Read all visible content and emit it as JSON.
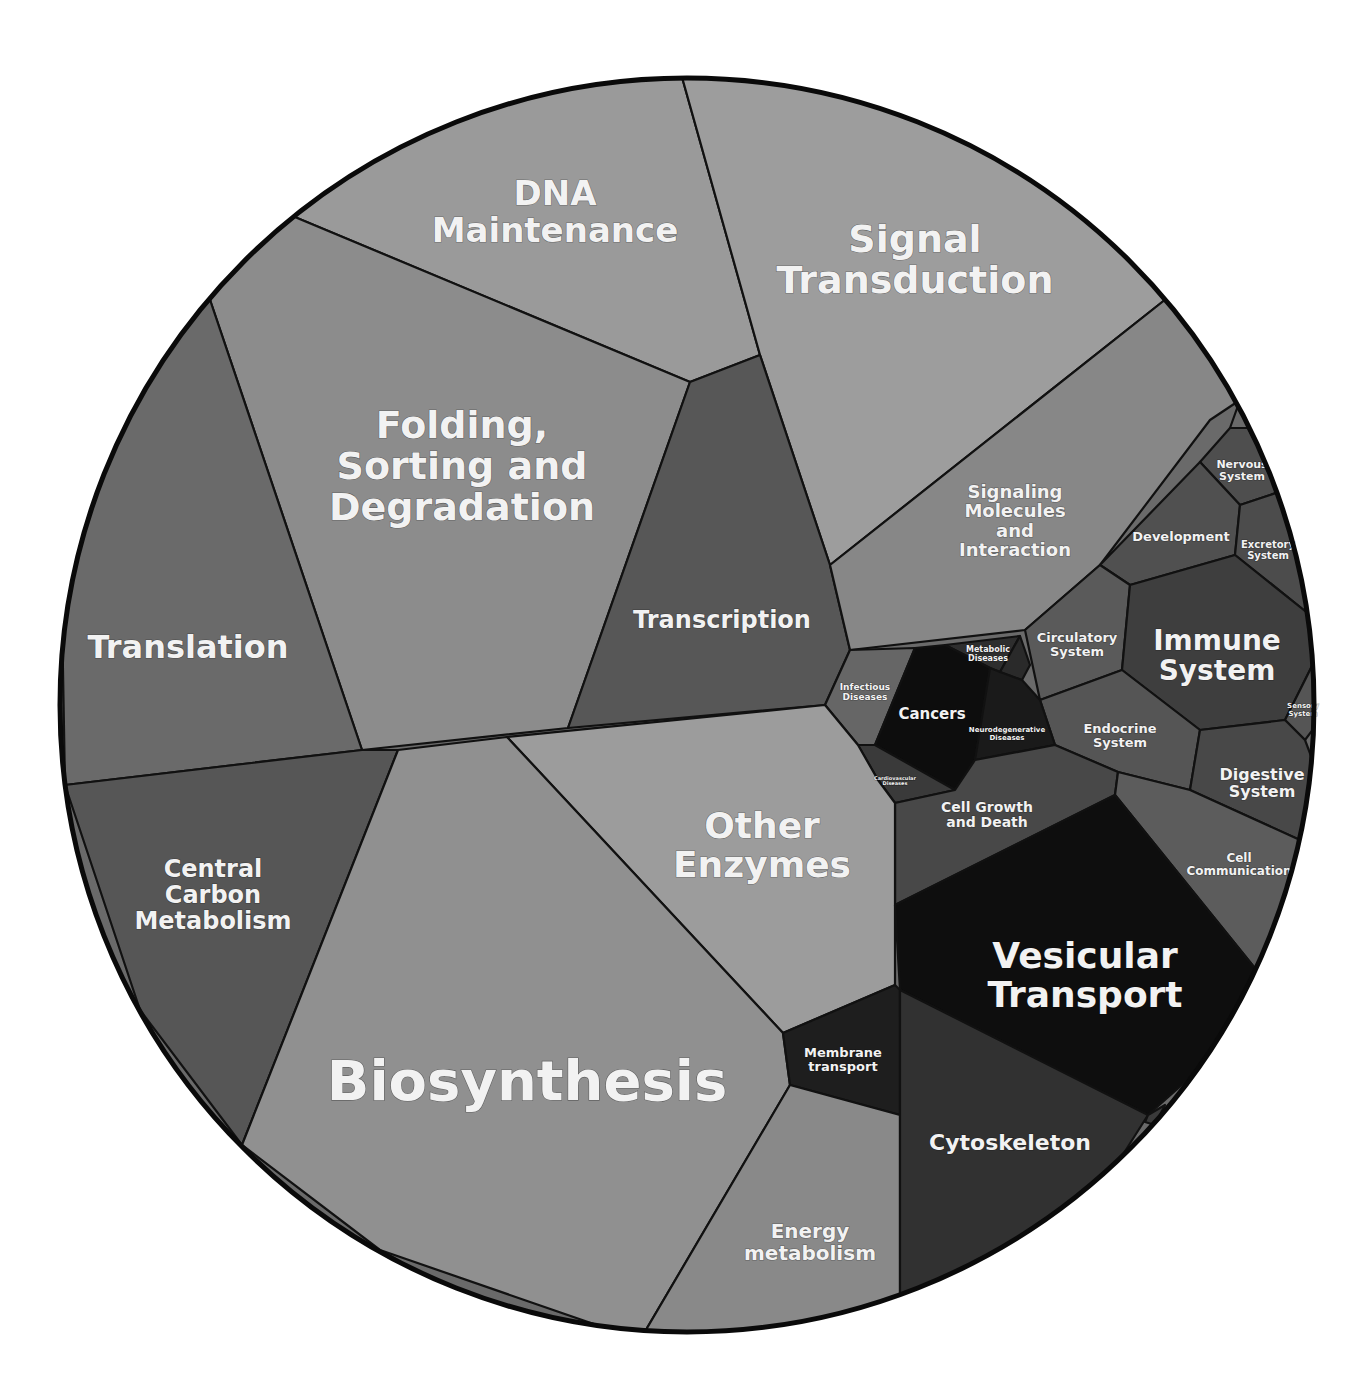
{
  "chart_data": {
    "type": "voronoi-treemap",
    "title": "",
    "center": [
      687,
      705
    ],
    "radius": 627,
    "cells": [
      {
        "id": "dna-maintenance",
        "label": [
          "DNA",
          "Maintenance"
        ],
        "fill": "#9a9a9a",
        "font": 34,
        "points": "290,215 400,120 580,75 680,70 760,355 690,382",
        "label_pos": [
          555,
          205
        ]
      },
      {
        "id": "signal-transduction",
        "label": [
          "Signal",
          "Transduction"
        ],
        "fill": "#9d9d9d",
        "font": 38,
        "points": "680,70 900,95 1100,180 1190,280 830,565 760,355",
        "label_pos": [
          915,
          252
        ]
      },
      {
        "id": "folding-sorting-degradation",
        "label": [
          "Folding,",
          "Sorting and",
          "Degradation"
        ],
        "fill": "#8c8c8c",
        "font": 38,
        "points": "205,285 290,215 690,382 568,728 362,750",
        "label_pos": [
          462,
          438
        ]
      },
      {
        "id": "translation",
        "label": [
          "Translation"
        ],
        "fill": "#6a6a6a",
        "font": 32,
        "points": "60,500 150,360 205,285 362,750 65,785",
        "label_pos": [
          188,
          658
        ]
      },
      {
        "id": "transcription",
        "label": [
          "Transcription"
        ],
        "fill": "#575757",
        "font": 24,
        "points": "690,382 760,355 830,565 850,650 825,705 568,728",
        "label_pos": [
          722,
          628
        ]
      },
      {
        "id": "signaling-molecules",
        "label": [
          "Signaling",
          "Molecules",
          "and",
          "Interaction"
        ],
        "fill": "#878787",
        "font": 18,
        "points": "830,565 1190,280 1240,400 1210,420 1100,565 1025,630 850,650",
        "label_pos": [
          1015,
          498
        ]
      },
      {
        "id": "tiny-top-right",
        "label": [
          ""
        ],
        "fill": "#6a6a6a",
        "font": 6,
        "points": "1240,400 1255,420 1248,428 1230,428",
        "label_pos": [
          1244,
          418
        ]
      },
      {
        "id": "nervous-system",
        "label": [
          "Nervous",
          "System"
        ],
        "fill": "#4e4e4e",
        "font": 11,
        "points": "1230,428 1248,428 1270,470 1285,490 1240,505 1200,462",
        "label_pos": [
          1242,
          468
        ]
      },
      {
        "id": "development",
        "label": [
          "Development"
        ],
        "fill": "#505050",
        "font": 13,
        "points": "1100,565 1200,462 1240,505 1235,555 1130,585",
        "label_pos": [
          1181,
          541
        ]
      },
      {
        "id": "excretory-system",
        "label": [
          "Excretory",
          "System"
        ],
        "fill": "#4c4c4c",
        "font": 10,
        "points": "1240,505 1285,490 1305,560 1310,615 1235,555",
        "label_pos": [
          1268,
          548
        ]
      },
      {
        "id": "circulatory-system",
        "label": [
          "Circulatory",
          "System"
        ],
        "fill": "#5a5a5a",
        "font": 13,
        "points": "1025,630 1100,565 1130,585 1122,670 1040,700",
        "label_pos": [
          1077,
          642
        ]
      },
      {
        "id": "immune-system",
        "label": [
          "Immune",
          "System"
        ],
        "fill": "#3e3e3e",
        "font": 28,
        "points": "1130,585 1235,555 1310,615 1315,660 1285,720 1200,730 1122,670",
        "label_pos": [
          1217,
          650
        ]
      },
      {
        "id": "sensory-system",
        "label": [
          "Sensory",
          "System"
        ],
        "fill": "#555555",
        "font": 7,
        "points": "1285,720 1315,660 1320,720 1305,740",
        "label_pos": [
          1303,
          708
        ]
      },
      {
        "id": "endocrine-system",
        "label": [
          "Endocrine",
          "System"
        ],
        "fill": "#555555",
        "font": 13,
        "points": "1040,700 1122,670 1200,730 1190,790 1118,772 1055,745",
        "label_pos": [
          1120,
          733
        ]
      },
      {
        "id": "digestive-system",
        "label": [
          "Digestive",
          "System"
        ],
        "fill": "#484848",
        "font": 16,
        "points": "1200,730 1285,720 1305,740 1320,780 1300,840 1190,790",
        "label_pos": [
          1262,
          780
        ]
      },
      {
        "id": "infectious-diseases",
        "label": [
          "Infectious",
          "Diseases"
        ],
        "fill": "#666666",
        "font": 9,
        "points": "850,650 915,648 875,745 858,745 825,705",
        "label_pos": [
          865,
          690
        ]
      },
      {
        "id": "metabolic-diseases",
        "label": [
          "Metabolic",
          "Diseases"
        ],
        "fill": "#2e2e2e",
        "font": 8,
        "points": "945,645 1020,636 1000,672 990,668",
        "label_pos": [
          988,
          652
        ]
      },
      {
        "id": "tiny-disease-a",
        "label": [
          ""
        ],
        "fill": "#2a2a2a",
        "font": 5,
        "points": "1000,672 1020,636 1030,665 1022,680",
        "label_pos": [
          1018,
          664
        ]
      },
      {
        "id": "cancers",
        "label": [
          "Cancers"
        ],
        "fill": "#0d0d0d",
        "font": 15,
        "points": "915,648 945,645 990,668 975,760 955,790 875,745",
        "label_pos": [
          932,
          719
        ]
      },
      {
        "id": "neurodegenerative-diseases",
        "label": [
          "Neurodegenerative",
          "Diseases"
        ],
        "fill": "#1a1a1a",
        "font": 7,
        "points": "990,668 1000,672 1022,680 1040,700 1055,745 975,760",
        "label_pos": [
          1007,
          732
        ]
      },
      {
        "id": "small-disease-b",
        "label": [
          "Cardiovascular",
          "Diseases"
        ],
        "fill": "#3a3a3a",
        "font": 5,
        "points": "858,745 875,745 955,790 895,803 878,780",
        "label_pos": [
          895,
          780
        ]
      },
      {
        "id": "cell-growth-death",
        "label": [
          "Cell Growth",
          "and Death"
        ],
        "fill": "#484848",
        "font": 14,
        "points": "895,803 955,790 975,760 1055,745 1118,772 1115,795 895,905",
        "label_pos": [
          987,
          812
        ]
      },
      {
        "id": "cell-communication",
        "label": [
          "Cell",
          "Communication"
        ],
        "fill": "#5c5c5c",
        "font": 12,
        "points": "1118,772 1190,790 1300,840 1285,930 1258,972 1115,795",
        "label_pos": [
          1239,
          862
        ]
      },
      {
        "id": "other-enzymes",
        "label": [
          "Other",
          "Enzymes"
        ],
        "fill": "#9c9c9c",
        "font": 36,
        "points": "507,737 825,705 858,745 878,780 895,803 895,985 783,1033",
        "label_pos": [
          762,
          838
        ]
      },
      {
        "id": "vesicular-transport",
        "label": [
          "Vesicular",
          "Transport"
        ],
        "fill": "#0e0e0e",
        "font": 36,
        "points": "895,905 1115,795 1258,972 1210,1060 1148,1115 900,990",
        "label_pos": [
          1085,
          968
        ]
      },
      {
        "id": "central-carbon-metabolism",
        "label": [
          "Central",
          "Carbon",
          "Metabolism"
        ],
        "fill": "#565656",
        "font": 24,
        "points": "65,785 362,750 398,750 242,1145 140,1010",
        "label_pos": [
          213,
          877
        ]
      },
      {
        "id": "biosynthesis",
        "label": [
          "Biosynthesis"
        ],
        "fill": "#909090",
        "font": 56,
        "points": "398,750 507,737 783,1033 790,1085 640,1340 380,1250 242,1145",
        "label_pos": [
          527,
          1100
        ]
      },
      {
        "id": "membrane-transport",
        "label": [
          "Membrane",
          "transport"
        ],
        "fill": "#1e1e1e",
        "font": 13,
        "points": "783,1033 895,985 900,990 900,1115 790,1085",
        "label_pos": [
          843,
          1057
        ]
      },
      {
        "id": "energy-metabolism",
        "label": [
          "Energy",
          "metabolism"
        ],
        "fill": "#898989",
        "font": 20,
        "points": "790,1085 900,1115 900,1305 780,1335 640,1340",
        "label_pos": [
          810,
          1238
        ]
      },
      {
        "id": "cytoskeleton",
        "label": [
          "Cytoskeleton"
        ],
        "fill": "#313131",
        "font": 22,
        "points": "900,990 1148,1115 1110,1175 1000,1260 900,1305",
        "label_pos": [
          1010,
          1150
        ]
      },
      {
        "id": "tiny-bottom-right",
        "label": [
          ""
        ],
        "fill": "#3a3a3a",
        "font": 4,
        "points": "1148,1115 1165,1105 1155,1125 1145,1122",
        "label_pos": [
          1155,
          1115
        ]
      }
    ]
  }
}
